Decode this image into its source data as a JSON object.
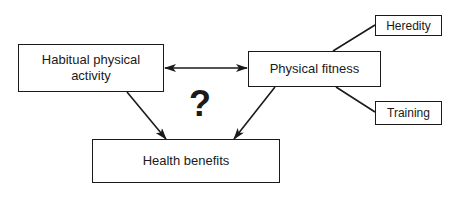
{
  "diagram": {
    "nodes": {
      "habitual_activity": {
        "label": "Habitual physical activity",
        "line1": "Habitual physical",
        "line2": "activity"
      },
      "physical_fitness": {
        "label": "Physical fitness"
      },
      "heredity": {
        "label": "Heredity"
      },
      "training": {
        "label": "Training"
      },
      "health_benefits": {
        "label": "Health benefits"
      }
    },
    "question_mark": "?",
    "edges": [
      {
        "from": "habitual_activity",
        "to": "physical_fitness",
        "type": "bidirectional-arrow"
      },
      {
        "from": "habitual_activity",
        "to": "health_benefits",
        "type": "arrow"
      },
      {
        "from": "physical_fitness",
        "to": "health_benefits",
        "type": "arrow"
      },
      {
        "from": "heredity",
        "to": "physical_fitness",
        "type": "line"
      },
      {
        "from": "training",
        "to": "physical_fitness",
        "type": "line"
      }
    ],
    "colors": {
      "stroke": "#1a1a1a",
      "background": "#ffffff"
    }
  }
}
